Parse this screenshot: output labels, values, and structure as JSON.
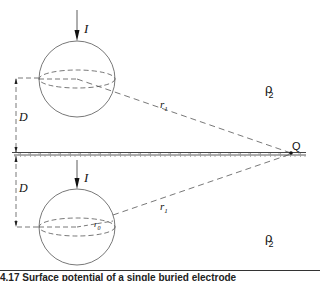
{
  "diagram": {
    "labels": {
      "current_top": "I",
      "current_bottom": "I",
      "depth_top": "D",
      "depth_bottom": "D",
      "distance_top": "r",
      "distance_top_sub": "1",
      "distance_bottom": "r",
      "distance_bottom_sub": "1",
      "radius": "r",
      "radius_sub": "0",
      "observation_point": "Q",
      "resistivity_top": "ρ",
      "resistivity_top_sub": "2",
      "resistivity_bottom": "ρ",
      "resistivity_bottom_sub": "2"
    },
    "elements": {
      "source_sphere": "buried spherical electrode",
      "image_sphere": "image spherical electrode",
      "surface": "ground surface (hatched)"
    }
  },
  "caption": {
    "text": "4.17  Surface potential of a single buried electrode"
  }
}
